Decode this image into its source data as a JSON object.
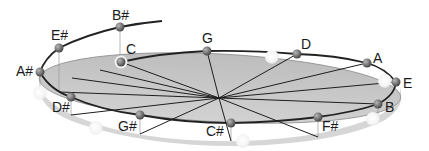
{
  "diagram": {
    "colors": {
      "disk_fill": "#c8c8c8",
      "disk_edge": "#8a8a8a",
      "spiral": "#222222",
      "spoke": "#1e1e1e",
      "node": "#7a7a7a",
      "ghost_node": "#f4f4f4",
      "label": "#1a1a1a"
    },
    "center": {
      "x": 219,
      "y": 98
    },
    "notes": [
      {
        "id": "bsharp",
        "label": "B#",
        "x": 120,
        "y": 27,
        "lx": 112,
        "ly": 20,
        "on_disk": false
      },
      {
        "id": "esharp",
        "label": "E#",
        "x": 59,
        "y": 48,
        "lx": 51,
        "ly": 40,
        "on_disk": false
      },
      {
        "id": "asharp",
        "label": "A#",
        "x": 40,
        "y": 72,
        "lx": 16,
        "ly": 76,
        "on_disk": false
      },
      {
        "id": "c",
        "label": "C",
        "x": 121,
        "y": 62,
        "lx": 126,
        "ly": 54,
        "on_disk": true
      },
      {
        "id": "g",
        "label": "G",
        "x": 207,
        "y": 51,
        "lx": 202,
        "ly": 43,
        "on_disk": true
      },
      {
        "id": "d",
        "label": "D",
        "x": 297,
        "y": 54,
        "lx": 301,
        "ly": 49,
        "on_disk": true
      },
      {
        "id": "a",
        "label": "A",
        "x": 367,
        "y": 63,
        "lx": 373,
        "ly": 63,
        "on_disk": true
      },
      {
        "id": "e",
        "label": "E",
        "x": 396,
        "y": 82,
        "lx": 403,
        "ly": 88,
        "on_disk": true
      },
      {
        "id": "b",
        "label": "B",
        "x": 378,
        "y": 104,
        "lx": 385,
        "ly": 112,
        "on_disk": true
      },
      {
        "id": "fsharp",
        "label": "F#",
        "x": 318,
        "y": 117,
        "lx": 322,
        "ly": 131,
        "on_disk": true
      },
      {
        "id": "csharp",
        "label": "C#",
        "x": 231,
        "y": 123,
        "lx": 206,
        "ly": 136,
        "on_disk": true
      },
      {
        "id": "gsharp",
        "label": "G#",
        "x": 140,
        "y": 115,
        "lx": 118,
        "ly": 131,
        "on_disk": true
      },
      {
        "id": "dsharp",
        "label": "D#",
        "x": 71,
        "y": 97,
        "lx": 52,
        "ly": 112,
        "on_disk": true
      }
    ],
    "ghost_nodes": [
      {
        "id": "ghost-near-d",
        "x": 272,
        "y": 57
      },
      {
        "id": "ghost-near-e",
        "x": 385,
        "y": 81
      },
      {
        "id": "ghost-near-b",
        "x": 373,
        "y": 119
      },
      {
        "id": "ghost-near-csharp",
        "x": 243,
        "y": 141
      },
      {
        "id": "ghost-near-gsharp",
        "x": 96,
        "y": 128
      },
      {
        "id": "ghost-near-asharp",
        "x": 40,
        "y": 93
      }
    ]
  }
}
